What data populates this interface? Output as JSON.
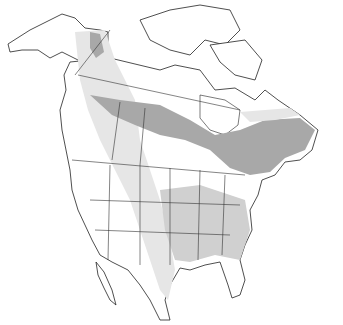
{
  "map": {
    "region": "North America",
    "type": "species range map",
    "legend": [],
    "shading": {
      "light_range": "#e6e6e6",
      "medium_range": "#d0d0d0",
      "dark_range": "#a8a8a8",
      "background": "#ffffff",
      "outline": "#222222"
    }
  }
}
